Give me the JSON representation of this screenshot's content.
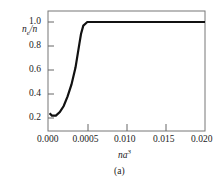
{
  "chart_data": {
    "type": "line",
    "title": "",
    "caption": "(a)",
    "xlabel": "na^3",
    "ylabel": "n_e/n",
    "x_ticks": [
      "0.000",
      "0.0005",
      "0.010",
      "0.015",
      "0.020"
    ],
    "y_ticks": [
      "0.2",
      "0.4",
      "0.6",
      "0.8",
      "1.0"
    ],
    "xlim": [
      0.0,
      0.02
    ],
    "ylim": [
      0.1,
      1.1
    ],
    "grid": false,
    "series": [
      {
        "name": "n_e/n",
        "x": [
          0.0002,
          0.0005,
          0.001,
          0.0015,
          0.002,
          0.0025,
          0.003,
          0.0035,
          0.004,
          0.0042,
          0.0045,
          0.005,
          0.0055,
          0.006,
          0.008,
          0.01,
          0.015,
          0.02
        ],
        "y": [
          0.24,
          0.22,
          0.22,
          0.25,
          0.3,
          0.38,
          0.48,
          0.62,
          0.82,
          0.9,
          0.97,
          1.0,
          1.0,
          1.0,
          1.0,
          1.0,
          1.0,
          1.0
        ]
      }
    ]
  },
  "labels": {
    "ylabel_main": "n",
    "ylabel_sub": "e",
    "ylabel_rest": "/n",
    "xlabel_main": "na",
    "xlabel_sup": "3",
    "caption": "(a)"
  }
}
